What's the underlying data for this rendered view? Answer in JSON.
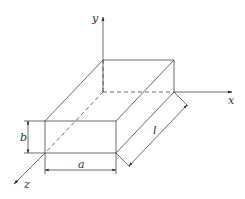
{
  "diagram": {
    "type": "3d-rectangular-box-with-axes",
    "axes": {
      "x": "x",
      "y": "y",
      "z": "z"
    },
    "dimensions": {
      "width": "a",
      "height": "b",
      "length": "l"
    }
  }
}
